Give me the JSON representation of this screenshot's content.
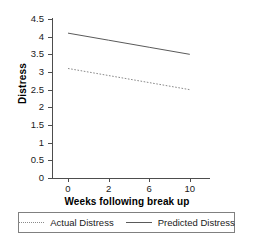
{
  "chart_data": {
    "type": "line",
    "title": "",
    "xlabel": "Weeks following break up",
    "ylabel": "Distress",
    "categories": [
      "0",
      "2",
      "6",
      "10"
    ],
    "x_tick_labels": [
      "0",
      "2",
      "6",
      "10"
    ],
    "y_tick_labels": [
      "4.5",
      "4",
      "3.5",
      "3",
      "2.5",
      "2",
      "1.5",
      "1",
      "0.5",
      "0"
    ],
    "y_tick_values": [
      4.5,
      4,
      3.5,
      3,
      2.5,
      2,
      1.5,
      1,
      0.5,
      0
    ],
    "ylim": [
      0,
      4.5
    ],
    "grid": false,
    "legend_position": "bottom",
    "series": [
      {
        "name": "Actual Distress",
        "style": "dotted",
        "color": "#8a8a8a",
        "values": [
          3.1,
          2.9,
          2.7,
          2.5
        ]
      },
      {
        "name": "Predicted Distress",
        "style": "solid",
        "color": "#5a5a5a",
        "values": [
          4.1,
          3.9,
          3.7,
          3.5
        ]
      }
    ]
  },
  "axes": {
    "y_title": "Distress",
    "x_title": "Weeks following break up",
    "y_ticks": [
      {
        "label": "4.5"
      },
      {
        "label": "4"
      },
      {
        "label": "3.5"
      },
      {
        "label": "3"
      },
      {
        "label": "2.5"
      },
      {
        "label": "2"
      },
      {
        "label": "1.5"
      },
      {
        "label": "1"
      },
      {
        "label": "0.5"
      },
      {
        "label": "0"
      }
    ],
    "x_ticks": [
      {
        "label": "0"
      },
      {
        "label": "2"
      },
      {
        "label": "6"
      },
      {
        "label": "10"
      }
    ]
  },
  "legend": {
    "entries": [
      {
        "label": "Actual Distress",
        "style": "dotted"
      },
      {
        "label": "Predicted Distress",
        "style": "solid"
      }
    ]
  }
}
